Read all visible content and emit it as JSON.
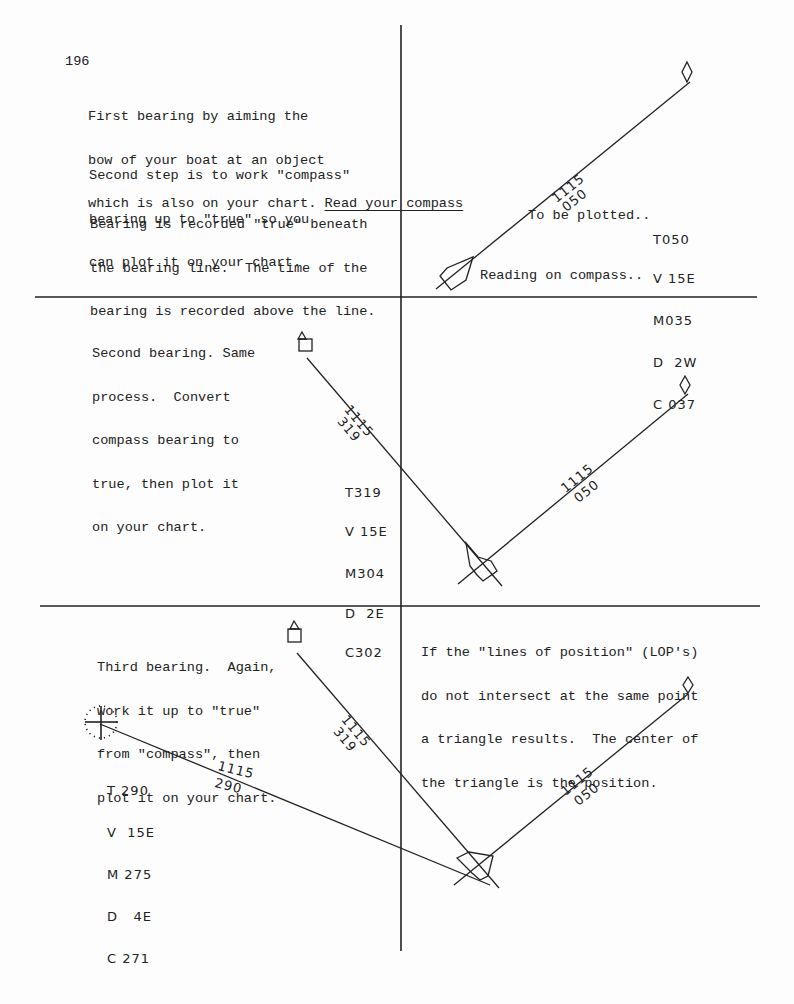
{
  "page_number": "196",
  "panel1": {
    "para1": [
      "First bearing by aiming the",
      "bow of your boat at an object",
      "which is also on your chart. "
    ],
    "para1_link": "Read your compass",
    "para2": [
      "Second step is to work \"compass\"",
      "bearing up to \"true\" so you",
      "can plot it on your chart."
    ],
    "para3": [
      "Bearing is recorded \"true\" beneath",
      "the bearing line.  The time of the",
      "bearing is recorded above the line."
    ],
    "line_label_time": "1115",
    "line_label_bearing": "050",
    "to_be_plotted_label": "To be plotted..",
    "reading_label": "Reading on compass..",
    "calc": [
      {
        "letter": "T",
        "value": "050"
      },
      {
        "letter": "V",
        "value": " 15E"
      },
      {
        "letter": "M",
        "value": "035"
      },
      {
        "letter": "D",
        "value": "  2W"
      },
      {
        "letter": "C",
        "value": " 037"
      }
    ]
  },
  "panel2": {
    "text": [
      "Second bearing. Same",
      "process.  Convert",
      "compass bearing to",
      "true, then plot it",
      "on your chart."
    ],
    "line319_time": "1115",
    "line319_bearing": "319",
    "line050_time": "1115",
    "line050_bearing": "050",
    "calc": [
      {
        "letter": "T",
        "value": "319"
      },
      {
        "letter": "V",
        "value": " 15E"
      },
      {
        "letter": "M",
        "value": "304"
      },
      {
        "letter": "D",
        "value": "  2E"
      },
      {
        "letter": "C",
        "value": "302"
      }
    ]
  },
  "panel3": {
    "text": [
      "Third bearing.  Again,",
      "work it up to \"true\"",
      "from \"compass\", then",
      "plot it on your chart."
    ],
    "line290_time": "1115",
    "line290_bearing": "290",
    "line319_time": "1115",
    "line319_bearing": "319",
    "calc": [
      {
        "letter": "T",
        "value": "290"
      },
      {
        "letter": "V",
        "value": " 15E"
      },
      {
        "letter": "M",
        "value": "275"
      },
      {
        "letter": "D",
        "value": "  4E"
      },
      {
        "letter": "C",
        "value": "271"
      }
    ]
  },
  "panel4": {
    "text": [
      "If the \"lines of position\" (LOP's)",
      "do not intersect at the same point",
      "a triangle results.  The center of",
      "the triangle is the position."
    ],
    "line050_time": "1115",
    "line050_bearing": "050"
  },
  "colors": {
    "ink": "#222222",
    "paper": "#fdfdfd"
  },
  "symbols": {
    "landmark_diamond": "diamond-marker",
    "landmark_tower": "tower-marker",
    "landmark_light": "light-crosshair-marker",
    "boat": "boat-symbol"
  }
}
